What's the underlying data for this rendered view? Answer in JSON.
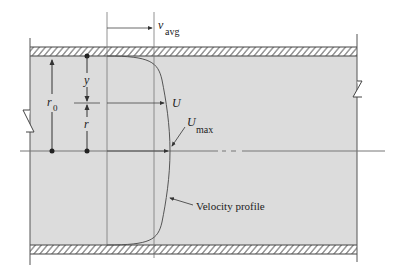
{
  "diagram": {
    "type": "pipe-flow-velocity-profile",
    "colors": {
      "fluid_fill": "#dcdcdc",
      "wall_hatch": "#555555",
      "line": "#444444",
      "background": "#ffffff"
    },
    "labels": {
      "v_avg_main": "v",
      "v_avg_sub": "avg",
      "y": "y",
      "r0_main": "r",
      "r0_sub": "0",
      "r": "r",
      "U": "U",
      "Umax_main": "U",
      "Umax_sub": "max",
      "velocity_profile": "Velocity profile"
    }
  }
}
